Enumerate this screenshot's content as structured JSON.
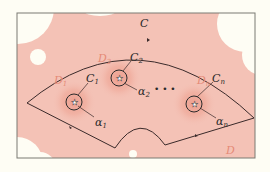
{
  "diagram": {
    "colors": {
      "background": "#fefdf4",
      "domain_fill": "#f4c2b6",
      "disk_glow": "#ec9f90",
      "contour": "#3a2a2a",
      "frame": "#7a7a72",
      "red_label": "#e58a76",
      "hole": "#fefdf4"
    },
    "labels": {
      "contour": "C",
      "domain": "D",
      "disks": [
        {
          "name": "D",
          "sub": "1"
        },
        {
          "name": "D",
          "sub": "2"
        },
        {
          "name": "D",
          "sub": "n"
        }
      ],
      "circles": [
        {
          "name": "C",
          "sub": "1"
        },
        {
          "name": "C",
          "sub": "2"
        },
        {
          "name": "C",
          "sub": "n"
        }
      ],
      "points": [
        {
          "name": "α",
          "sub": "1"
        },
        {
          "name": "α",
          "sub": "2"
        },
        {
          "name": "α",
          "sub": "n"
        }
      ],
      "ellipsis": "• • •"
    },
    "icons": {
      "puncture": "star-icon"
    }
  }
}
